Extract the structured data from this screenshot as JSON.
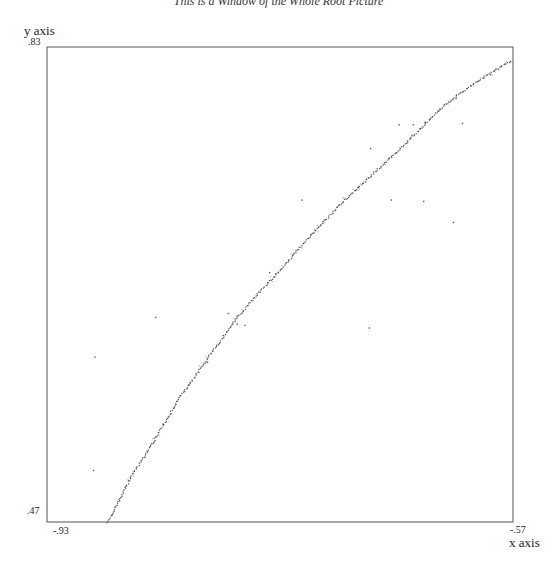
{
  "chart_data": {
    "type": "scatter",
    "title": "This is a Window of the Whole Root Picture",
    "xlabel": "x axis",
    "ylabel": "y axis",
    "xlim": [
      -0.93,
      -0.57
    ],
    "ylim": [
      0.47,
      0.83
    ],
    "x_tick_labels": [
      "-.93",
      "-.57"
    ],
    "y_tick_labels": [
      ".47",
      ".83"
    ],
    "grid": false,
    "legend": null,
    "curve_points": [
      {
        "x": -0.883,
        "y": 0.47
      },
      {
        "x": -0.864,
        "y": 0.506
      },
      {
        "x": -0.847,
        "y": 0.532
      },
      {
        "x": -0.829,
        "y": 0.562
      },
      {
        "x": -0.808,
        "y": 0.591
      },
      {
        "x": -0.783,
        "y": 0.625
      },
      {
        "x": -0.769,
        "y": 0.641
      },
      {
        "x": -0.744,
        "y": 0.667
      },
      {
        "x": -0.735,
        "y": 0.678
      },
      {
        "x": -0.7,
        "y": 0.714
      },
      {
        "x": -0.657,
        "y": 0.753
      },
      {
        "x": -0.623,
        "y": 0.786
      },
      {
        "x": -0.599,
        "y": 0.803
      },
      {
        "x": -0.571,
        "y": 0.82
      }
    ],
    "outlier_points": [
      {
        "x": -0.846,
        "y": 0.625
      },
      {
        "x": -0.893,
        "y": 0.595
      },
      {
        "x": -0.806,
        "y": 0.591
      },
      {
        "x": -0.783,
        "y": 0.62
      },
      {
        "x": -0.79,
        "y": 0.628
      },
      {
        "x": -0.777,
        "y": 0.619
      },
      {
        "x": -0.758,
        "y": 0.659
      },
      {
        "x": -0.733,
        "y": 0.714
      },
      {
        "x": -0.68,
        "y": 0.753
      },
      {
        "x": -0.664,
        "y": 0.714
      },
      {
        "x": -0.681,
        "y": 0.617
      },
      {
        "x": -0.658,
        "y": 0.771
      },
      {
        "x": -0.647,
        "y": 0.771
      },
      {
        "x": -0.638,
        "y": 0.773
      },
      {
        "x": -0.639,
        "y": 0.713
      },
      {
        "x": -0.614,
        "y": 0.791
      },
      {
        "x": -0.609,
        "y": 0.772
      },
      {
        "x": -0.616,
        "y": 0.697
      },
      {
        "x": -0.894,
        "y": 0.509
      }
    ]
  },
  "plot_frame": {
    "left": 47,
    "top": 47,
    "right": 513,
    "bottom": 522
  },
  "colors": {
    "axis": "#555555",
    "points": "#333333",
    "background": "#ffffff"
  }
}
